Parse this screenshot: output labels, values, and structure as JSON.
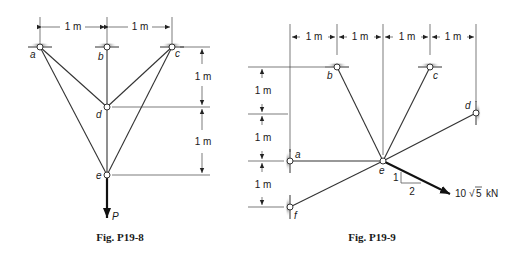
{
  "figures": [
    {
      "caption": "Fig. P19-8",
      "nodes": {
        "a": {
          "label": "a",
          "type": "support"
        },
        "b": {
          "label": "b",
          "type": "support"
        },
        "c": {
          "label": "c",
          "type": "support"
        },
        "d": {
          "label": "d",
          "type": "joint"
        },
        "e": {
          "label": "e",
          "type": "joint"
        }
      },
      "members": [
        "a-d",
        "a-e",
        "b-d",
        "d-e",
        "c-d",
        "c-e"
      ],
      "dimensions": {
        "horizontal": [
          "1 m",
          "1 m"
        ],
        "vertical": [
          "1 m",
          "1 m"
        ]
      },
      "load": {
        "label": "P",
        "direction": "down",
        "at": "e"
      }
    },
    {
      "caption": "Fig. P19-9",
      "nodes": {
        "a": {
          "label": "a",
          "type": "support"
        },
        "b": {
          "label": "b",
          "type": "support"
        },
        "c": {
          "label": "c",
          "type": "support"
        },
        "d": {
          "label": "d",
          "type": "support"
        },
        "e": {
          "label": "e",
          "type": "joint"
        },
        "f": {
          "label": "f",
          "type": "support"
        }
      },
      "members": [
        "a-e",
        "b-e",
        "c-e",
        "d-e",
        "f-e"
      ],
      "dimensions": {
        "horizontal": [
          "1 m",
          "1 m",
          "1 m",
          "1 m"
        ],
        "vertical": [
          "1 m",
          "1 m",
          "1 m"
        ]
      },
      "load": {
        "magnitude": "10",
        "radical": "√",
        "radicand": "5",
        "unit": "kN",
        "slope_rise": "1",
        "slope_run": "2",
        "at": "e"
      }
    }
  ]
}
